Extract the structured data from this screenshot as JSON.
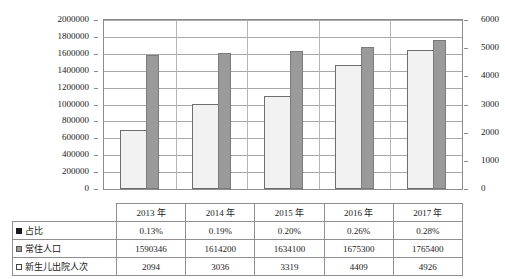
{
  "chart_data": {
    "type": "bar",
    "title": "",
    "subtitle": "",
    "xlabel": "",
    "categories": [
      "2013 年",
      "2014 年",
      "2015 年",
      "2016 年",
      "2017 年"
    ],
    "grid": true,
    "legend_position": "bottom-table",
    "axes": {
      "left": {
        "label": "",
        "ylim": [
          0,
          2000000
        ],
        "ticks": [
          0,
          200000,
          400000,
          600000,
          800000,
          1000000,
          1200000,
          1400000,
          1600000,
          1800000,
          2000000
        ],
        "tick_labels": [
          "0",
          "200000",
          "400000",
          "600000",
          "800000",
          "1000000",
          "1200000",
          "1400000",
          "1600000",
          "1800000",
          "2000000"
        ]
      },
      "right": {
        "label": "",
        "ylim": [
          0,
          6000
        ],
        "ticks": [
          0,
          1000,
          2000,
          3000,
          4000,
          5000,
          6000
        ],
        "tick_labels": [
          "0",
          "1000",
          "2000",
          "3000",
          "4000",
          "5000",
          "6000"
        ]
      }
    },
    "series": [
      {
        "name": "占比",
        "marker": "black-square",
        "color": "#1a1a1a",
        "axis": "none",
        "plotted": false,
        "values": [
          "0.13%",
          "0.19%",
          "0.20%",
          "0.26%",
          "0.28%"
        ]
      },
      {
        "name": "常住人口",
        "marker": "gray-square",
        "color": "#9a9a9a",
        "axis": "left",
        "plotted": true,
        "values": [
          1590346,
          1614200,
          1634100,
          1675300,
          1765400
        ]
      },
      {
        "name": "新生儿出院人次",
        "marker": "white-square",
        "color": "#f2f2f2",
        "axis": "right",
        "plotted": true,
        "values": [
          2094,
          3036,
          3319,
          4409,
          4926
        ]
      }
    ]
  },
  "table": {
    "year_header": [
      "2013 年",
      "2014 年",
      "2015 年",
      "2016 年",
      "2017 年"
    ],
    "rows": [
      {
        "label": "占比",
        "swatch": "black-square",
        "cells": [
          "0.13%",
          "0.19%",
          "0.20%",
          "0.26%",
          "0.28%"
        ]
      },
      {
        "label": "常住人口",
        "swatch": "gray-square",
        "cells": [
          "1590346",
          "1614200",
          "1634100",
          "1675300",
          "1765400"
        ]
      },
      {
        "label": "新生儿出院人次",
        "swatch": "white-square",
        "cells": [
          "2094",
          "3036",
          "3319",
          "4409",
          "4926"
        ]
      }
    ]
  },
  "colors": {
    "gray_bar": "#9a9a9a",
    "white_bar": "#f2f2f2",
    "border": "#8c8c8c",
    "grid": "#a8a8a8",
    "text": "#1a1a1a"
  }
}
